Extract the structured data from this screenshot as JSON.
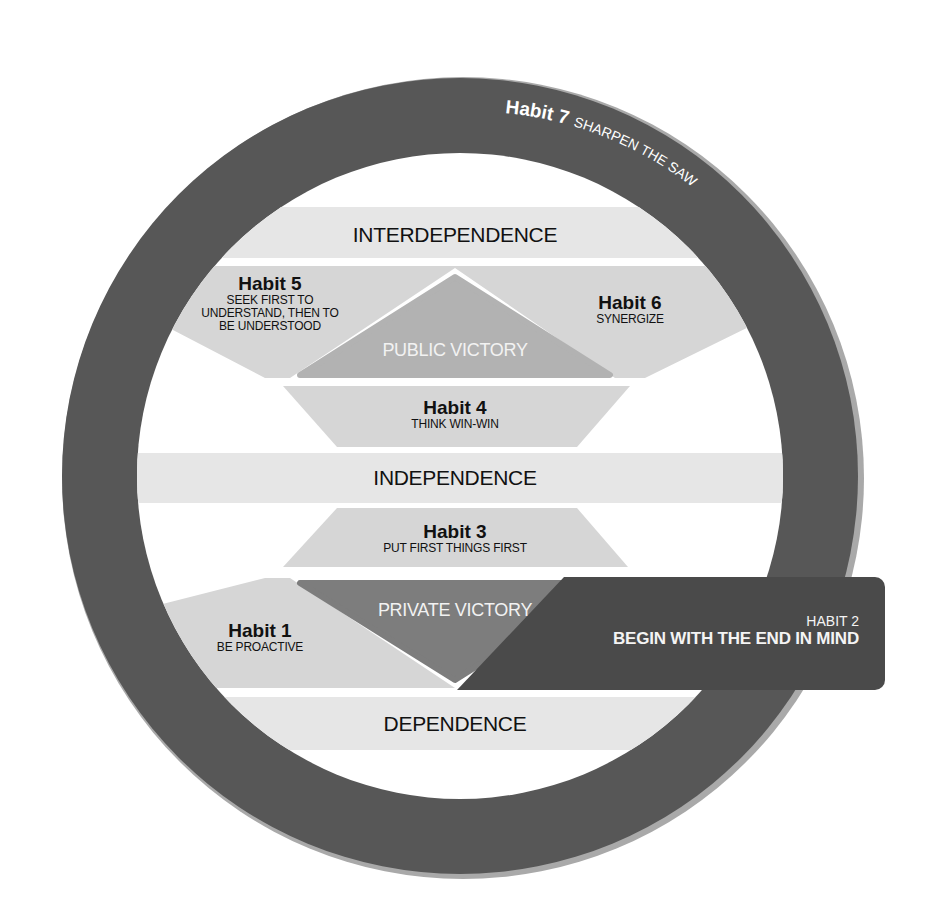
{
  "diagram": {
    "type": "7 Habits maturity continuum",
    "colors": {
      "ring": "#575757",
      "ring_edge": "#a9a9a9",
      "band": "#e6e6e6",
      "habit_shape": "#d6d6d6",
      "public_victory": "#b2b2b2",
      "private_victory": "#7d7d7d",
      "habit2_box": "#4a4a4a",
      "background": "#ffffff"
    },
    "ring_text": {
      "habit_label": "Habit 7",
      "habit_name": "SHARPEN THE SAW"
    },
    "bands": {
      "interdependence": "INTERDEPENDENCE",
      "independence": "INDEPENDENCE",
      "dependence": "DEPENDENCE"
    },
    "victories": {
      "public": "PUBLIC VICTORY",
      "private": "PRIVATE VICTORY"
    },
    "habits": {
      "h1": {
        "title": "Habit 1",
        "subtitle": "BE PROACTIVE"
      },
      "h2": {
        "title": "HABIT 2",
        "subtitle": "BEGIN WITH THE END IN MIND"
      },
      "h3": {
        "title": "Habit 3",
        "subtitle": "PUT FIRST THINGS FIRST"
      },
      "h4": {
        "title": "Habit 4",
        "subtitle": "THINK WIN-WIN"
      },
      "h5": {
        "title": "Habit 5",
        "subtitle_lines": [
          "SEEK FIRST TO",
          "UNDERSTAND, THEN TO",
          "BE UNDERSTOOD"
        ]
      },
      "h6": {
        "title": "Habit 6",
        "subtitle": "SYNERGIZE"
      }
    }
  }
}
